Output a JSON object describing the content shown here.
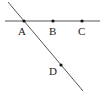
{
  "diagram": {
    "type": "geometry",
    "lines": [
      {
        "name": "horizontal-line",
        "through": [
          "A",
          "B",
          "C"
        ]
      },
      {
        "name": "diagonal-line",
        "through": [
          "A",
          "D"
        ]
      }
    ],
    "points": [
      {
        "label": "A",
        "x": 24,
        "y": 21
      },
      {
        "label": "B",
        "x": 53,
        "y": 21
      },
      {
        "label": "C",
        "x": 82,
        "y": 21
      },
      {
        "label": "D",
        "x": 61,
        "y": 65
      }
    ],
    "colors": {
      "line": "#555555",
      "point": "#111111",
      "background": "#ffffff"
    }
  }
}
